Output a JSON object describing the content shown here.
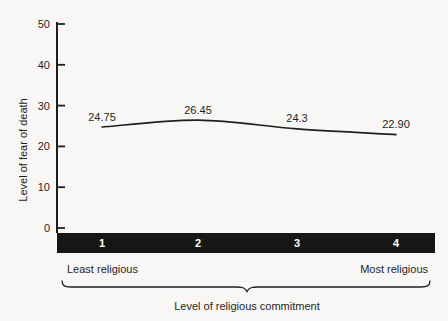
{
  "y_axis": {
    "title": "Level of fear of death"
  },
  "x_axis": {
    "end_label_left": "Least religious",
    "end_label_right": "Most religious",
    "group_label": "Level of religious commitment"
  },
  "chart_data": {
    "type": "line",
    "categories": [
      "1",
      "2",
      "3",
      "4"
    ],
    "values": [
      24.75,
      26.45,
      24.3,
      22.9
    ],
    "value_labels": [
      "24.75",
      "26.45",
      "24.3",
      "22.90"
    ],
    "title": "",
    "xlabel": "Level of religious commitment",
    "ylabel": "Level of fear of death",
    "ylim": [
      0,
      50
    ],
    "yticks": [
      0,
      10,
      20,
      30,
      40,
      50
    ],
    "x_end_labels": [
      "Least religious",
      "Most religious"
    ],
    "grid": false,
    "legend": "none"
  },
  "colors": {
    "background": "#f8f7f5",
    "ink": "#1f1f1f",
    "line": "#1f1f1f",
    "bar_fill": "#161616",
    "bar_number": "#ffffff"
  }
}
